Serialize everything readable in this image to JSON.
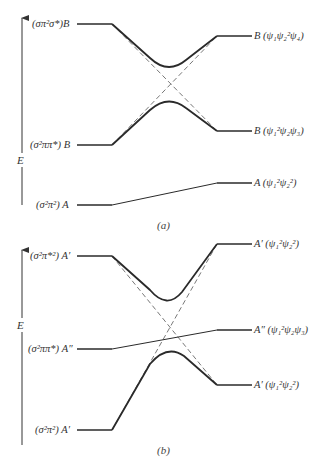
{
  "diagram_a": {
    "caption": "(a)",
    "axis_label": "E",
    "left_levels": [
      {
        "label": "(σπ²σ*)B",
        "y": 24
      },
      {
        "label": "(σ²ππ*) B",
        "y": 145
      },
      {
        "label": "(σ²π²) A",
        "y": 205
      }
    ],
    "right_levels": [
      {
        "label": "B (ψ₁ψ₂²ψ₄)",
        "y": 36
      },
      {
        "label": "B (ψ₁²ψ₂ψ₃)",
        "y": 131
      },
      {
        "label": "A (ψ₁²ψ₂²)",
        "y": 183
      }
    ]
  },
  "diagram_b": {
    "caption": "(b)",
    "axis_label": "E",
    "left_levels": [
      {
        "label": "(σ²π*²) A′",
        "y": 256
      },
      {
        "label": "(σ²ππ*) A″",
        "y": 349
      },
      {
        "label": "(σ²π²) A′",
        "y": 430
      }
    ],
    "right_levels": [
      {
        "label": "A′ (ψ₁²ψ₂²)",
        "y": 244
      },
      {
        "label": "A″ (ψ₁²ψ₂ψ₃)",
        "y": 330
      },
      {
        "label": "A′ (ψ₁²ψ₂²)",
        "y": 385
      }
    ]
  },
  "colors": {
    "line": "#2a2a2a",
    "dashed": "#555555",
    "text": "#333333"
  }
}
